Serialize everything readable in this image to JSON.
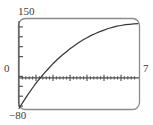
{
  "figure": {
    "kind": "graphing-calculator-plot",
    "frame_color": "#8a8a8a",
    "curve_color": "#3a3a3a",
    "axis_color": "#4a4a4a",
    "background": "#ffffff"
  },
  "labels": {
    "y_max": "150",
    "y_min": "−80",
    "origin": "0",
    "x_max": "7"
  },
  "chart_data": {
    "type": "line",
    "title": "",
    "xlabel": "",
    "ylabel": "",
    "xlim": [
      0,
      7
    ],
    "ylim": [
      -80,
      150
    ],
    "grid": false,
    "legend": "none",
    "x_ticks_major": [
      1,
      2,
      3,
      4,
      5,
      6
    ],
    "x_ticks_minor_step": 0.2,
    "y_ticks_major": [
      -50,
      0,
      50,
      100
    ],
    "y_tick_step": 25,
    "x_axis_at_y": 0,
    "y_axis_at_x": 0,
    "x_intercept": 1.05,
    "series": [
      {
        "name": "curve",
        "x": [
          0.0,
          0.25,
          0.5,
          0.75,
          1.0,
          1.25,
          1.5,
          1.75,
          2.0,
          2.25,
          2.5,
          2.75,
          3.0,
          3.25,
          3.5,
          3.75,
          4.0,
          4.25,
          4.5,
          4.75,
          5.0,
          5.25,
          5.5,
          5.75,
          6.0,
          6.25,
          6.5,
          6.75,
          7.0
        ],
        "y": [
          -80,
          -62,
          -45,
          -29,
          -14,
          0,
          13,
          25,
          37,
          48,
          58,
          67,
          76,
          84,
          92,
          99,
          105,
          111,
          116,
          121,
          125,
          129,
          132,
          135,
          137,
          139,
          140,
          141,
          142
        ]
      }
    ]
  }
}
